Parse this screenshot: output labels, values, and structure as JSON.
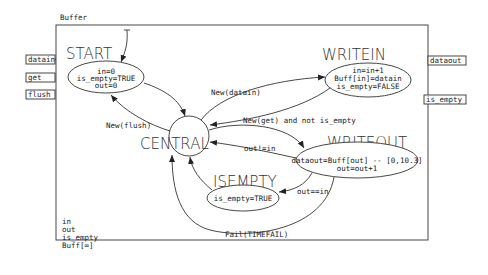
{
  "diagram": {
    "container_label": "Buffer",
    "input_ports": [
      "datain",
      "get",
      "flush"
    ],
    "output_ports": [
      "dataout",
      "is_empty"
    ],
    "variables": [
      "in",
      "out",
      "is_empty",
      "Buff[∞]"
    ],
    "states": {
      "start": {
        "name": "START",
        "actions": [
          "in=0",
          "is_empty=TRUE",
          "out=0"
        ]
      },
      "writein": {
        "name": "WRITEIN",
        "actions": [
          "in=in+1",
          "Buff[in]=datain",
          "is_empty=FALSE"
        ]
      },
      "central": {
        "name": "CENTRAL"
      },
      "writeout": {
        "name": "WRITEOUT",
        "actions": [
          "dataout=Buff[out] -- [0,10.3]",
          "out=out+1"
        ]
      },
      "isempty": {
        "name": "ISEMPTY",
        "actions": [
          "is_empty=TRUE"
        ]
      }
    },
    "transitions": {
      "new_datain": "New(datain)",
      "new_flush": "New(flush)",
      "new_get": "New(get) and not is_empty",
      "out_ne_in": "out!=in",
      "out_eq_in": "out==in",
      "fail": "Fail(TIMEFAIL)"
    }
  }
}
